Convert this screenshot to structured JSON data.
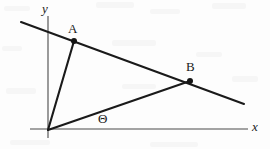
{
  "figure": {
    "background_color": "#fdfdfd",
    "stroke_color": "#1a1a1a",
    "axes": {
      "x_axis_label": "x",
      "y_axis_label": "y",
      "x_axis": {
        "x1": 30,
        "y1": 129,
        "x2": 248,
        "y2": 129,
        "width": 1.1
      },
      "y_axis": {
        "x1": 48,
        "y1": 16,
        "x2": 48,
        "y2": 138,
        "width": 1.1
      },
      "x_label_pos": {
        "x": 252,
        "y": 120
      },
      "y_label_pos": {
        "x": 42,
        "y": 2
      }
    },
    "origin": {
      "x": 48,
      "y": 130
    },
    "points": [
      {
        "name": "A",
        "x": 74,
        "y": 41,
        "dot_radius": 3.0,
        "label": "A",
        "label_x": 68,
        "label_y": 22
      },
      {
        "name": "B",
        "x": 190,
        "y": 81,
        "dot_radius": 3.0,
        "label": "B",
        "label_x": 186,
        "label_y": 60
      }
    ],
    "lines": [
      {
        "name": "secant-line-through-A-and-B",
        "x1": 21,
        "y1": 22,
        "x2": 244,
        "y2": 104,
        "width": 2.1
      },
      {
        "name": "ray-origin-to-A",
        "x1": 48,
        "y1": 130,
        "x2": 74,
        "y2": 41,
        "width": 2.1
      },
      {
        "name": "ray-origin-to-B",
        "x1": 48,
        "y1": 130,
        "x2": 190,
        "y2": 81,
        "width": 2.1
      }
    ],
    "angle": {
      "symbol": "Θ",
      "label": "angle-theta",
      "x": 98,
      "y": 112,
      "between": [
        "x-axis",
        "ray-origin-to-B"
      ]
    }
  }
}
